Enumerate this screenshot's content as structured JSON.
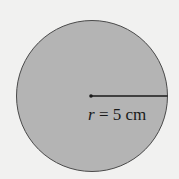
{
  "diagram": {
    "shape": "circle",
    "fill_color": "#b4b4b4",
    "stroke_color": "#4a4a4a",
    "background_color": "#f1f1f0",
    "radius_label": {
      "variable": "r",
      "equals": " = ",
      "value": "5",
      "unit": " cm"
    }
  }
}
